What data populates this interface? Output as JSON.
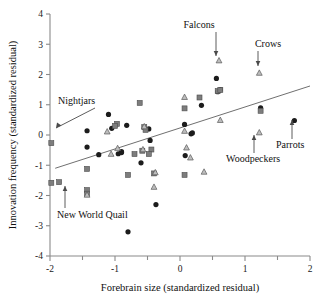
{
  "chart_data": {
    "type": "scatter",
    "title": "",
    "xlabel": "Forebrain size (standardized residual)",
    "ylabel": "Innovation frequency (standardized residual)",
    "xlim": [
      -2,
      2
    ],
    "ylim": [
      -4,
      4
    ],
    "xticks": [
      -2,
      -1,
      0,
      1,
      2
    ],
    "xtick_labels": [
      "-2",
      "-1",
      "0",
      "1",
      "2"
    ],
    "xminor_ticks": [
      -1.5,
      -0.5,
      0.5,
      1.5
    ],
    "yticks": [
      -4,
      -3,
      -2,
      -1,
      0,
      1,
      2,
      3,
      4
    ],
    "ytick_labels": [
      "-4",
      "-3",
      "-2",
      "-1",
      "0",
      "1",
      "2",
      "3",
      "4"
    ],
    "grid": false,
    "legend": "none",
    "series": [
      {
        "name": "circle-group",
        "marker": "circle",
        "color": "#1c1c1c",
        "points": [
          [
            -1.43,
            0.14
          ],
          [
            -1.43,
            -0.4
          ],
          [
            -1.25,
            -0.65
          ],
          [
            -1.1,
            0.68
          ],
          [
            -1.05,
            0.22
          ],
          [
            -0.95,
            -0.62
          ],
          [
            -0.9,
            -0.55
          ],
          [
            -0.82,
            0.32
          ],
          [
            -0.8,
            -3.2
          ],
          [
            -0.6,
            -0.92
          ],
          [
            -0.48,
            0.2
          ],
          [
            -0.37,
            -2.3
          ],
          [
            -0.46,
            -0.18
          ],
          [
            0.07,
            0.35
          ],
          [
            0.08,
            -0.68
          ],
          [
            0.17,
            0.04
          ],
          [
            0.19,
            0.07
          ],
          [
            0.33,
            0.98
          ],
          [
            0.56,
            1.87
          ],
          [
            0.58,
            1.43
          ],
          [
            0.62,
            1.5
          ],
          [
            1.24,
            0.9
          ],
          [
            1.76,
            0.48
          ],
          [
            -0.9,
            -0.58
          ]
        ]
      },
      {
        "name": "square-group",
        "marker": "square",
        "color": "#7d7d7d",
        "points": [
          [
            -1.98,
            -1.58
          ],
          [
            -1.86,
            -1.56
          ],
          [
            -1.98,
            -0.27
          ],
          [
            -1.43,
            -1.12
          ],
          [
            -1.43,
            -1.82
          ],
          [
            -1.43,
            -1.94
          ],
          [
            -0.97,
            0.37
          ],
          [
            -1.0,
            0.3
          ],
          [
            -0.8,
            -1.32
          ],
          [
            -0.62,
            1.06
          ],
          [
            -0.55,
            0.26
          ],
          [
            -0.53,
            0.17
          ],
          [
            -0.7,
            -0.63
          ],
          [
            -0.58,
            -0.52
          ],
          [
            -0.44,
            -0.48
          ],
          [
            -0.4,
            -1.27
          ],
          [
            0.07,
            0.88
          ],
          [
            0.07,
            -1.32
          ],
          [
            0.3,
            1.24
          ],
          [
            0.58,
            1.45
          ],
          [
            0.62,
            1.49
          ],
          [
            1.24,
            0.8
          ],
          [
            -0.48,
            -0.63
          ]
        ]
      },
      {
        "name": "triangle-group",
        "marker": "triangle",
        "color": "#bdbdbd",
        "points": [
          [
            -1.43,
            -1.98
          ],
          [
            -1.12,
            0.11
          ],
          [
            -1.06,
            -0.63
          ],
          [
            -0.57,
            -0.48
          ],
          [
            -0.55,
            0.28
          ],
          [
            -0.4,
            -1.72
          ],
          [
            -0.38,
            -1.24
          ],
          [
            0.07,
            1.25
          ],
          [
            0.07,
            0.13
          ],
          [
            0.1,
            -0.42
          ],
          [
            0.16,
            -0.75
          ],
          [
            0.37,
            -1.22
          ],
          [
            0.6,
            2.46
          ],
          [
            0.62,
            0.49
          ],
          [
            1.22,
            2.05
          ],
          [
            1.22,
            0.08
          ],
          [
            -0.96,
            -0.44
          ]
        ]
      }
    ],
    "fit_line": {
      "x0": -1.92,
      "y0": -1.1,
      "x1": 2.0,
      "y1": 1.62,
      "style": "solid"
    },
    "annotations": [
      {
        "name": "nightjars",
        "label": "Nightjars",
        "target_x": -1.98,
        "target_y": -0.27
      },
      {
        "name": "new-world-quail",
        "label": "New World Quail",
        "target_x": -1.86,
        "target_y": -1.56
      },
      {
        "name": "falcons",
        "label": "Falcons",
        "target_x": 0.6,
        "target_y": 2.46
      },
      {
        "name": "crows",
        "label": "Crows",
        "target_x": 1.22,
        "target_y": 2.05
      },
      {
        "name": "woodpeckers",
        "label": "Woodpeckers",
        "target_x": 1.22,
        "target_y": 0.08
      },
      {
        "name": "parrots",
        "label": "Parrots",
        "target_x": 1.76,
        "target_y": 0.48
      }
    ]
  }
}
